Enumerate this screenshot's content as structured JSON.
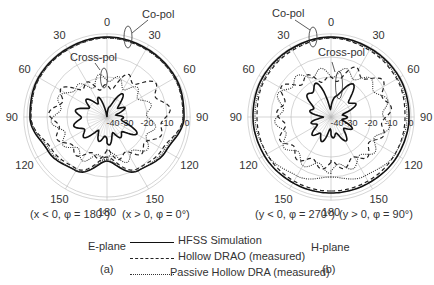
{
  "chart_data": [
    {
      "type": "polar",
      "panel": "(a)",
      "plane": "E-plane",
      "left_half_label": "(x < 0, φ = 180°)",
      "right_half_label": "(x > 0, φ = 0°)",
      "angle_ticks": [
        "0",
        "30",
        "60",
        "90",
        "120",
        "150",
        "180",
        "150",
        "120",
        "90",
        "60",
        "30"
      ],
      "radial_ticks": [
        "-40",
        "-30",
        "-20",
        "-10",
        "0"
      ],
      "rlim": [
        -40,
        0
      ],
      "annotations": [
        "Co-pol",
        "Cross-pol"
      ],
      "series": [
        {
          "name": "HFSS Simulation",
          "style": "solid",
          "co_pol_db": {
            "theta": [
              -180,
              -150,
              -120,
              -90,
              -60,
              -30,
              0,
              30,
              60,
              90,
              120,
              150,
              180
            ],
            "values": [
              -18,
              -9,
              -6,
              -1.5,
              -0.5,
              -0.5,
              0,
              -0.5,
              -0.5,
              -1.5,
              -6,
              -9,
              -18
            ]
          },
          "cross_pol_db": {
            "theta": [
              -180,
              -150,
              -120,
              -90,
              -60,
              -30,
              0,
              30,
              60,
              90,
              120,
              150,
              180
            ],
            "values": [
              -28,
              -30,
              -25,
              -25,
              -28,
              -30,
              -40,
              -28,
              -32,
              -34,
              -25,
              -30,
              -28
            ]
          }
        },
        {
          "name": "Hollow DRAO (measured)",
          "style": "dashed",
          "co_pol_db": {
            "theta": [
              -180,
              -150,
              -120,
              -90,
              -60,
              -30,
              0,
              30,
              60,
              90,
              120,
              150,
              180
            ],
            "values": [
              -20,
              -10,
              -8,
              -2,
              -1,
              -1,
              -0.5,
              -1,
              -1,
              -2,
              -8,
              -10,
              -20
            ]
          },
          "cross_pol_db": {
            "theta": [
              -180,
              -150,
              -120,
              -90,
              -60,
              -30,
              0,
              30,
              60,
              90,
              120,
              150,
              180
            ],
            "values": [
              -22,
              -18,
              -15,
              -13,
              -15,
              -22,
              -26,
              -18,
              -12,
              -10,
              -15,
              -18,
              -22
            ]
          }
        },
        {
          "name": "Passive Hollow DRA (measured)",
          "style": "dotted",
          "co_pol_db": {
            "theta": [
              -180,
              -150,
              -120,
              -90,
              -60,
              -30,
              0,
              30,
              60,
              90,
              120,
              150,
              180
            ],
            "values": [
              -19,
              -9,
              -7,
              -2,
              -1,
              -1,
              -0.5,
              -1,
              -1,
              -2,
              -7,
              -9,
              -19
            ]
          },
          "cross_pol_db": {
            "theta": [
              -180,
              -150,
              -120,
              -90,
              -60,
              -30,
              0,
              30,
              60,
              90,
              120,
              150,
              180
            ],
            "values": [
              -20,
              -17,
              -16,
              -14,
              -16,
              -22,
              -20,
              -22,
              -20,
              -18,
              -16,
              -17,
              -20
            ]
          }
        }
      ]
    },
    {
      "type": "polar",
      "panel": "(b)",
      "plane": "H-plane",
      "left_half_label": "(y < 0, φ = 270°)",
      "right_half_label": "(y > 0, φ = 90°)",
      "angle_ticks": [
        "0",
        "30",
        "60",
        "90",
        "120",
        "150",
        "180",
        "150",
        "120",
        "90",
        "60",
        "30"
      ],
      "radial_ticks": [
        "-40",
        "-30",
        "-20",
        "-10",
        "0"
      ],
      "rlim": [
        -40,
        0
      ],
      "annotations": [
        "Co-pol",
        "Cross-pol"
      ],
      "series": [
        {
          "name": "HFSS Simulation",
          "style": "solid",
          "co_pol_db": {
            "theta": [
              -180,
              -150,
              -120,
              -90,
              -60,
              -30,
              0,
              30,
              60,
              90,
              120,
              150,
              180
            ],
            "values": [
              -2,
              -2,
              -1.5,
              -1,
              -0.5,
              -0.5,
              0,
              -0.5,
              -0.5,
              -1,
              -1.5,
              -2,
              -2
            ]
          },
          "cross_pol_db": {
            "theta": [
              -180,
              -150,
              -120,
              -90,
              -60,
              -30,
              0,
              30,
              60,
              90,
              120,
              150,
              180
            ],
            "values": [
              -32,
              -28,
              -30,
              -34,
              -28,
              -22,
              -35,
              -22,
              -28,
              -34,
              -30,
              -28,
              -32
            ]
          }
        },
        {
          "name": "Hollow DRAO (measured)",
          "style": "dashed",
          "co_pol_db": {
            "theta": [
              -180,
              -150,
              -120,
              -90,
              -60,
              -30,
              0,
              30,
              60,
              90,
              120,
              150,
              180
            ],
            "values": [
              -3,
              -3,
              -3,
              -3,
              -2,
              -1.5,
              -0.5,
              -1.5,
              -2,
              -3,
              -3,
              -3,
              -3
            ]
          },
          "cross_pol_db": {
            "theta": [
              -180,
              -150,
              -120,
              -90,
              -60,
              -30,
              0,
              30,
              60,
              90,
              120,
              150,
              180
            ],
            "values": [
              -16,
              -15,
              -14,
              -15,
              -13,
              -18,
              -22,
              -14,
              -10,
              -12,
              -15,
              -15,
              -16
            ]
          }
        },
        {
          "name": "Passive Hollow DRA (measured)",
          "style": "dotted",
          "co_pol_db": {
            "theta": [
              -180,
              -150,
              -120,
              -90,
              -60,
              -30,
              0,
              30,
              60,
              90,
              120,
              150,
              180
            ],
            "values": [
              -10,
              -6,
              -3,
              -2,
              -1.5,
              -1,
              -0.5,
              -1,
              -1.5,
              -2,
              -3,
              -6,
              -10
            ]
          },
          "cross_pol_db": {
            "theta": [
              -180,
              -150,
              -120,
              -90,
              -60,
              -30,
              0,
              30,
              60,
              90,
              120,
              150,
              180
            ],
            "values": [
              -14,
              -14,
              -14,
              -14,
              -13,
              -16,
              -18,
              -16,
              -13,
              -12,
              -14,
              -14,
              -14
            ]
          }
        }
      ]
    }
  ],
  "labels": {
    "angles": {
      "a0": "0",
      "a30": "30",
      "a60": "60",
      "a90": "90",
      "a120": "120",
      "a150": "150",
      "a180": "180"
    },
    "radial": [
      "-40",
      "-30",
      "-20",
      "-10",
      "0"
    ],
    "copol": "Co-pol",
    "crosspol": "Cross-pol",
    "a_left": "(x < 0, φ = 180°)",
    "a_right": "(x > 0, φ = 0°)",
    "b_left": "(y < 0, φ = 270°)",
    "b_right": "(y > 0, φ = 90°)",
    "eplane": "E-plane",
    "hplane": "H-plane",
    "panel_a": "(a)",
    "panel_b": "(b)"
  },
  "legend": [
    {
      "label": "HFSS Simulation",
      "style": "solid"
    },
    {
      "label": "Hollow DRAO (measured)",
      "style": "dashed"
    },
    {
      "label": "Passive Hollow DRA (measured)",
      "style": "dotted"
    }
  ]
}
